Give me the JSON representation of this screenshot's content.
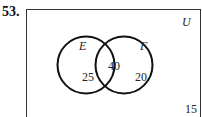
{
  "problem_number": "53.",
  "universe_label": "U",
  "sets": [
    {
      "name": "E",
      "only_count": "25"
    },
    {
      "name": "F",
      "only_count": "20"
    }
  ],
  "intersection_count": "40",
  "outside_count": "15"
}
